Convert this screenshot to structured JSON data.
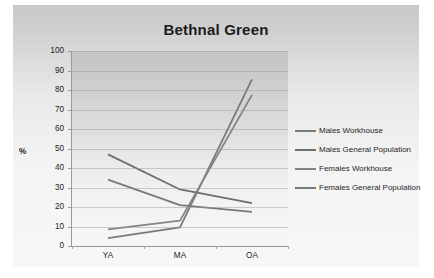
{
  "chart_data": {
    "type": "line",
    "title": "Bethnal Green",
    "xlabel": "",
    "ylabel": "%",
    "categories": [
      "YA",
      "MA",
      "OA"
    ],
    "ylim": [
      0,
      100
    ],
    "ytick_step": 10,
    "yticks": [
      0,
      10,
      20,
      30,
      40,
      50,
      60,
      70,
      80,
      90,
      100
    ],
    "grid": true,
    "legend_position": "right",
    "series": [
      {
        "name": "Males Workhouse",
        "values": [
          4,
          9.5,
          85.5
        ],
        "color": "#7a7a7a"
      },
      {
        "name": "Males General Population",
        "values": [
          47,
          29,
          22
        ],
        "color": "#6e6e6e"
      },
      {
        "name": "Females Workhouse",
        "values": [
          8.5,
          13,
          77.5
        ],
        "color": "#848484"
      },
      {
        "name": "Females General Population",
        "values": [
          34,
          21,
          17.5
        ],
        "color": "#787878"
      }
    ]
  },
  "legend": {
    "items": [
      "Males Workhouse",
      "Males General Population",
      "Females Workhouse",
      "Females General Population"
    ]
  },
  "axis": {
    "y_labels": [
      "100",
      "90",
      "80",
      "70",
      "60",
      "50",
      "40",
      "30",
      "20",
      "10",
      "0"
    ],
    "x_labels": [
      "YA",
      "MA",
      "OA"
    ],
    "y_axis_title": "%"
  },
  "colors": {
    "panel_background": "#d5d5d5",
    "plot_background": "#dcdcdc",
    "gridline": "#969696",
    "text": "#242424",
    "line": "#767676"
  }
}
